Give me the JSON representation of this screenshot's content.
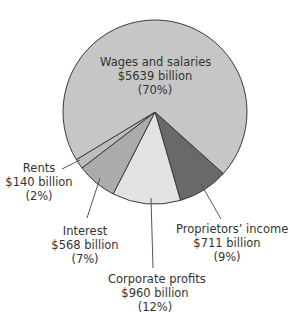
{
  "chart_data": {
    "type": "pie",
    "title": "",
    "unit": "billion dollars",
    "slices": [
      {
        "label": "Wages and salaries",
        "value": 5639,
        "value_text": "$5639 billion",
        "percent": 70,
        "percent_text": "(70%)",
        "color": "#c6c6c6"
      },
      {
        "label": "Proprietors’ income",
        "value": 711,
        "value_text": "$711 billion",
        "percent": 9,
        "percent_text": "(9%)",
        "color": "#696969"
      },
      {
        "label": "Corporate profits",
        "value": 960,
        "value_text": "$960 billion",
        "percent": 12,
        "percent_text": "(12%)",
        "color": "#e3e3e3"
      },
      {
        "label": "Interest",
        "value": 568,
        "value_text": "$568 billion",
        "percent": 7,
        "percent_text": "(7%)",
        "color": "#ababab"
      },
      {
        "label": "Rents",
        "value": 140,
        "value_text": "$140 billion",
        "percent": 2,
        "percent_text": "(2%)",
        "color": "#bdbdbd"
      }
    ],
    "legend": "none (direct labels with leader lines)"
  }
}
